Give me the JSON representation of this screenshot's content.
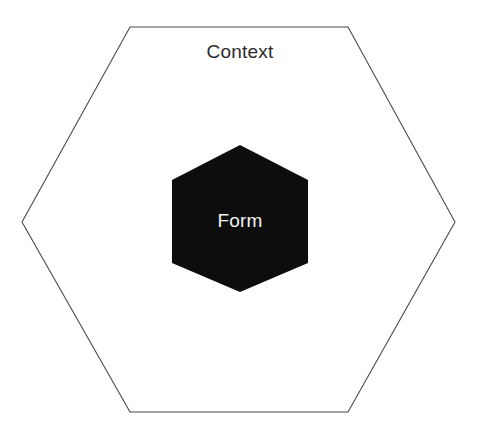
{
  "diagram": {
    "type": "nested-hexagon-diagram",
    "canvas": {
      "width": 482,
      "height": 447,
      "background_color": "#ffffff"
    },
    "outer_shape": {
      "name": "Context",
      "label": "Context",
      "shape": "hexagon",
      "orientation": "flat-top",
      "fill_color": "none",
      "stroke_color": "#4a4a4a",
      "stroke_width": 1.1,
      "points": "130,27 348,27 455,222 348,412 130,412 22,222",
      "label_x": 240,
      "label_y": 58,
      "label_color": "#2b2b2b",
      "label_font_size": 19
    },
    "inner_shape": {
      "name": "Form",
      "label": "Form",
      "shape": "hexagon",
      "orientation": "pointy-top",
      "fill_color": "#0d0d0d",
      "stroke_color": "none",
      "points": "240,145 308,180 308,263 240,292 172,263 172,180",
      "label_x": 240,
      "label_y": 227,
      "label_color": "#f2f2f2",
      "label_font_size": 19
    }
  }
}
